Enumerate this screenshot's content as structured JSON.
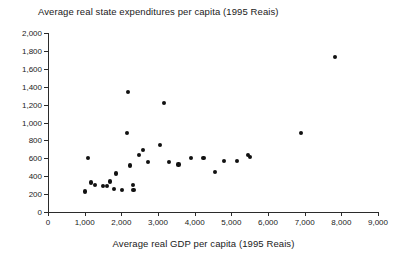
{
  "chart_data": {
    "type": "scatter",
    "title": "Average real state expenditures per capita (1995 Reais)",
    "xlabel": "Average real GDP per capita (1995 Reais)",
    "ylabel": "",
    "xlim": [
      0,
      9000
    ],
    "ylim": [
      0,
      2000
    ],
    "xticks": [
      0,
      1000,
      2000,
      3000,
      4000,
      5000,
      6000,
      7000,
      8000,
      9000
    ],
    "xtick_labels": [
      "0",
      "1,000",
      "2,000",
      "3,000",
      "4,000",
      "5,000",
      "6,000",
      "7,000",
      "8,000",
      "9,000"
    ],
    "yticks": [
      0,
      200,
      400,
      600,
      800,
      1000,
      1200,
      1400,
      1600,
      1800,
      2000
    ],
    "ytick_labels": [
      "0",
      "200",
      "400",
      "600",
      "800",
      "1,000",
      "1,200",
      "1,400",
      "1,600",
      "1,800",
      "2,000"
    ],
    "grid": false,
    "legend": null,
    "marker_color": "#111111",
    "points": [
      {
        "x": 1020,
        "y": 230
      },
      {
        "x": 1090,
        "y": 600
      },
      {
        "x": 1170,
        "y": 330
      },
      {
        "x": 1280,
        "y": 300
      },
      {
        "x": 1500,
        "y": 290
      },
      {
        "x": 1610,
        "y": 295
      },
      {
        "x": 1700,
        "y": 340
      },
      {
        "x": 1790,
        "y": 255
      },
      {
        "x": 1850,
        "y": 430
      },
      {
        "x": 2010,
        "y": 245
      },
      {
        "x": 2150,
        "y": 880
      },
      {
        "x": 2180,
        "y": 1340
      },
      {
        "x": 2230,
        "y": 520
      },
      {
        "x": 2310,
        "y": 300
      },
      {
        "x": 2330,
        "y": 250
      },
      {
        "x": 2490,
        "y": 640
      },
      {
        "x": 2580,
        "y": 690
      },
      {
        "x": 2720,
        "y": 560
      },
      {
        "x": 3050,
        "y": 750
      },
      {
        "x": 3160,
        "y": 1220
      },
      {
        "x": 3300,
        "y": 560
      },
      {
        "x": 3560,
        "y": 530
      },
      {
        "x": 3900,
        "y": 600
      },
      {
        "x": 4240,
        "y": 600
      },
      {
        "x": 4550,
        "y": 450
      },
      {
        "x": 4800,
        "y": 570
      },
      {
        "x": 5150,
        "y": 570
      },
      {
        "x": 5450,
        "y": 640
      },
      {
        "x": 5520,
        "y": 615
      },
      {
        "x": 6900,
        "y": 880
      },
      {
        "x": 7820,
        "y": 1730
      }
    ]
  }
}
